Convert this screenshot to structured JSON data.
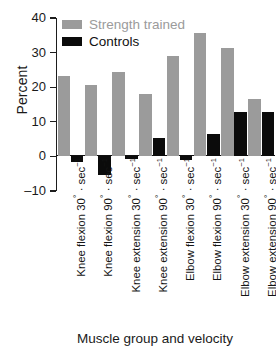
{
  "chart_data": {
    "type": "bar",
    "title": "",
    "xlabel": "Muscle group and velocity",
    "ylabel": "Percent",
    "ylim": [
      -10,
      40
    ],
    "yticks": [
      40,
      30,
      20,
      10,
      0,
      -10
    ],
    "ytick_labels": [
      "40",
      "30",
      "20",
      "10",
      "0",
      "–10"
    ],
    "grid": false,
    "legend_position": "top-left",
    "categories": [
      "Knee flexion 30° · sec⁻¹",
      "Knee flexion 90° · sec⁻¹",
      "Knee extension 30° · sec⁻¹",
      "Knee extension 90° · sec⁻¹",
      "Elbow flexion 30° · sec⁻¹",
      "Elbow flexion 90° · sec⁻¹",
      "Elbow extension 30° · sec⁻¹",
      "Elbow extension 90° · sec⁻¹"
    ],
    "series": [
      {
        "name": "Strength trained",
        "color": "#9b9b9b",
        "values": [
          23.2,
          20.7,
          24.3,
          18.0,
          29.0,
          35.7,
          31.2,
          16.6
        ]
      },
      {
        "name": "Controls",
        "color": "#0b0b0b",
        "values": [
          -1.6,
          -5.4,
          -0.8,
          5.2,
          -1.1,
          6.5,
          12.8,
          12.7
        ]
      }
    ]
  },
  "legend": {
    "items": [
      {
        "label": "Strength trained",
        "color": "#9b9b9b"
      },
      {
        "label": "Controls",
        "color": "#0b0b0b"
      }
    ]
  },
  "axes": {
    "y_title": "Percent",
    "x_title": "Muscle group and velocity"
  }
}
